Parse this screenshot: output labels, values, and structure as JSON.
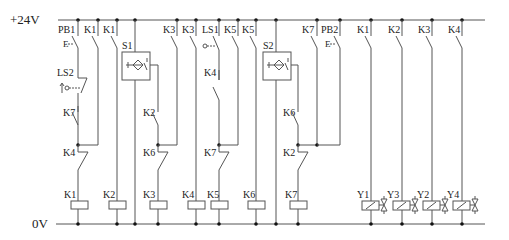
{
  "diagram": {
    "type": "relay-ladder-diagram",
    "rails": {
      "top_label": "+24V",
      "bottom_label": "0V",
      "top_y": 20,
      "bottom_y": 224,
      "x_start": 62,
      "x_end": 485
    },
    "colors": {
      "wire": "#555555",
      "dot": "#111111",
      "text": "#222222"
    },
    "rungs": [
      {
        "id": "r1",
        "x": 78,
        "coil": "K1",
        "contacts": [
          {
            "label": "PB1",
            "kind": "pushbutton-NO",
            "y": 40
          },
          {
            "label": "LS2",
            "kind": "limit-switch-NO",
            "y": 75
          },
          {
            "label": "K7",
            "kind": "NO",
            "y": 110
          },
          {
            "label": "K4",
            "kind": "NC",
            "y": 155
          }
        ],
        "latch": {
          "label": "K1",
          "x": 98,
          "join_y": 145
        }
      },
      {
        "id": "r2",
        "x": 117,
        "coil": "K2",
        "contacts": [
          {
            "label": "K1",
            "kind": "NO",
            "y": 40
          }
        ]
      },
      {
        "id": "r3",
        "x": 135,
        "coil": "K3",
        "sensor": {
          "label": "S1",
          "box": [
            122,
            52,
            28,
            28
          ],
          "out_x": 158
        },
        "contacts": [
          {
            "label": "K2",
            "kind": "NO",
            "y": 110,
            "x": 158
          },
          {
            "label": "K6",
            "kind": "NC",
            "y": 155,
            "x": 158
          }
        ],
        "latch": {
          "label": "K3",
          "x": 177,
          "join_y": 145
        }
      },
      {
        "id": "r4",
        "x": 196,
        "coil": "K4",
        "contacts": [
          {
            "label": "K3",
            "kind": "NO",
            "y": 40
          }
        ]
      },
      {
        "id": "r5",
        "x": 219,
        "coil": "K5",
        "contacts": [
          {
            "label": "LS1",
            "kind": "limit-switch-NO",
            "y": 40
          },
          {
            "label": "K4",
            "kind": "NO",
            "y": 85
          },
          {
            "label": "K7",
            "kind": "NC",
            "y": 155
          }
        ],
        "latch": {
          "label": "K5",
          "x": 238,
          "join_y": 145
        }
      },
      {
        "id": "r6",
        "x": 256,
        "coil": "K6",
        "contacts": [
          {
            "label": "K5",
            "kind": "NO",
            "y": 40
          }
        ]
      },
      {
        "id": "r7",
        "x": 276,
        "coil": "K7",
        "sensor": {
          "label": "S2",
          "box": [
            263,
            52,
            28,
            28
          ],
          "out_x": 298
        },
        "contacts": [
          {
            "label": "K6",
            "kind": "NO",
            "y": 110,
            "x": 298
          },
          {
            "label": "K2",
            "kind": "NC",
            "y": 155,
            "x": 298
          }
        ],
        "latch": {
          "label": "K7",
          "x": 317,
          "join_y": 145,
          "extra": {
            "label": "PB2",
            "x": 340,
            "kind": "pushbutton-NO"
          }
        }
      },
      {
        "id": "r8",
        "x": 371,
        "coil": "Y1",
        "solenoid": "Y1",
        "solenoid2": "Y3",
        "contacts": [
          {
            "label": "K1",
            "kind": "NO",
            "y": 40
          }
        ]
      },
      {
        "id": "r9",
        "x": 402,
        "solenoid": "Y3",
        "contacts": [
          {
            "label": "K2",
            "kind": "NO",
            "y": 40
          }
        ]
      },
      {
        "id": "r10",
        "x": 432,
        "solenoid": "Y2",
        "contacts": [
          {
            "label": "K3",
            "kind": "NO",
            "y": 40
          }
        ]
      },
      {
        "id": "r11",
        "x": 462,
        "solenoid": "Y4",
        "contacts": [
          {
            "label": "K4",
            "kind": "NO",
            "y": 40
          }
        ]
      }
    ],
    "labels": {
      "plus24": "+24V",
      "zero": "0V",
      "PB1": "PB1",
      "PB2": "PB2",
      "LS1": "LS1",
      "LS2": "LS2",
      "S1": "S1",
      "S2": "S2",
      "K1": "K1",
      "K2": "K2",
      "K3": "K3",
      "K4": "K4",
      "K5": "K5",
      "K6": "K6",
      "K7": "K7",
      "Y1": "Y1",
      "Y2": "Y2",
      "Y3": "Y3",
      "Y4": "Y4"
    },
    "coil_labels": [
      "K1",
      "K2",
      "K3",
      "K4",
      "K5",
      "K6",
      "K7"
    ],
    "solenoid_labels": [
      "Y1",
      "Y3",
      "Y2",
      "Y4"
    ]
  }
}
